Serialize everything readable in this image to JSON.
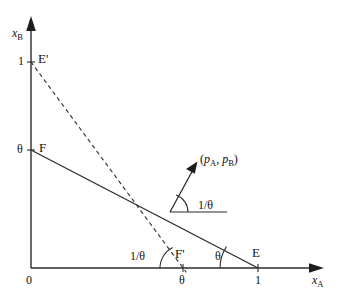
{
  "figure": {
    "type": "economics-diagram",
    "background_color": "#ffffff",
    "line_color": "#2b2b2b",
    "text_color": "#111111"
  },
  "axes": {
    "y": {
      "name_main": "x",
      "name_sub": "B",
      "ticks": [
        {
          "label": "1",
          "value": 1
        },
        {
          "label": "θ",
          "value": 0.7
        },
        {
          "label": "0",
          "value": 0
        }
      ]
    },
    "x": {
      "name_main": "x",
      "name_sub": "A",
      "ticks": [
        {
          "label": "0",
          "value": 0
        },
        {
          "label": "θ",
          "value": 0.67
        },
        {
          "label": "1",
          "value": 1
        }
      ]
    }
  },
  "points": [
    {
      "name": "E'",
      "label": "E'",
      "on": "y-axis",
      "at": "1"
    },
    {
      "name": "F",
      "label": "F",
      "on": "y-axis",
      "at": "θ"
    },
    {
      "name": "F'",
      "label": "F'",
      "on": "x-axis",
      "at": "θ"
    },
    {
      "name": "E",
      "label": "E",
      "on": "x-axis",
      "at": "1"
    }
  ],
  "lines": [
    {
      "name": "budget-line-FE",
      "style": "solid",
      "from": "F",
      "to": "E"
    },
    {
      "name": "dashed-line-E'F'",
      "style": "dashed",
      "from": "E'",
      "to": "F'"
    }
  ],
  "angles": [
    {
      "name": "angle-at-E",
      "label": "θ",
      "vertex": "E"
    },
    {
      "name": "angle-at-F-prime",
      "label": "1/θ",
      "vertex": "F'"
    },
    {
      "name": "angle-price-vector",
      "label": "1/θ",
      "vertex": "tangency-point"
    }
  ],
  "vector": {
    "name": "price-vector",
    "label_open": "(",
    "label_p1_main": "p",
    "label_p1_sub": "A",
    "label_sep": ", ",
    "label_p2_main": "p",
    "label_p2_sub": "B",
    "label_close": ")",
    "label_plain": "(p_A, p_B)"
  }
}
